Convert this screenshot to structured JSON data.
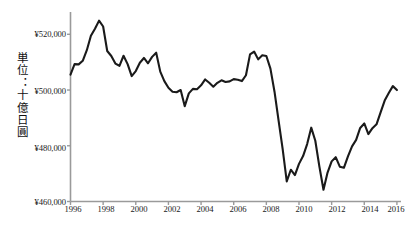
{
  "chart_data": {
    "type": "line",
    "title": "",
    "subtitle": "",
    "xlabel": "",
    "ylabel": "単位：十億日圓",
    "ylabel_reading": "tan'i: jūoku nippon-en (unit: billion yen)",
    "xlim": [
      1996.0,
      2016.25
    ],
    "ylim": [
      460000,
      528000
    ],
    "grid": false,
    "legend": null,
    "legend_position": "none",
    "y_tick_labels": [
      "¥520,000",
      "¥500,000",
      "¥480,000",
      "¥460,000"
    ],
    "y_ticks": [
      520000,
      500000,
      480000,
      460000
    ],
    "x_tick_labels": [
      "1996",
      "1998",
      "2000",
      "2002",
      "2004",
      "2006",
      "2008",
      "2010",
      "2012",
      "2014",
      "2016"
    ],
    "x_ticks": [
      1996,
      1998,
      2000,
      2002,
      2004,
      2006,
      2008,
      2010,
      2012,
      2014,
      2016
    ],
    "line_color": "#1a1a1a",
    "axis_color": "#9a9a9a",
    "background_color": "#ffffff",
    "series": [
      {
        "name": "Real GDP",
        "x": [
          1996.0,
          1996.25,
          1996.5,
          1996.75,
          1997.0,
          1997.25,
          1997.5,
          1997.75,
          1998.0,
          1998.25,
          1998.5,
          1998.75,
          1999.0,
          1999.25,
          1999.5,
          1999.75,
          2000.0,
          2000.25,
          2000.5,
          2000.75,
          2001.0,
          2001.25,
          2001.5,
          2001.75,
          2002.0,
          2002.25,
          2002.5,
          2002.75,
          2003.0,
          2003.25,
          2003.5,
          2003.75,
          2004.0,
          2004.25,
          2004.5,
          2004.75,
          2005.0,
          2005.25,
          2005.5,
          2005.75,
          2006.0,
          2006.25,
          2006.5,
          2006.75,
          2007.0,
          2007.25,
          2007.5,
          2007.75,
          2008.0,
          2008.25,
          2008.5,
          2008.75,
          2009.0,
          2009.25,
          2009.5,
          2009.75,
          2010.0,
          2010.25,
          2010.5,
          2010.75,
          2011.0,
          2011.25,
          2011.5,
          2011.75,
          2012.0,
          2012.25,
          2012.5,
          2012.75,
          2013.0,
          2013.25,
          2013.5,
          2013.75,
          2014.0,
          2014.25,
          2014.5,
          2014.75,
          2015.0,
          2015.25,
          2015.5,
          2015.75,
          2016.0
        ],
        "values": [
          505500,
          509300,
          509200,
          510500,
          514300,
          519500,
          522000,
          524900,
          522800,
          514000,
          512200,
          509500,
          508700,
          512300,
          509300,
          505000,
          506800,
          509800,
          511500,
          509600,
          511900,
          513400,
          506600,
          503200,
          500800,
          499400,
          499200,
          500000,
          494200,
          498800,
          500400,
          500300,
          501700,
          503800,
          502600,
          501200,
          502600,
          503500,
          502900,
          503100,
          503900,
          503700,
          503200,
          505300,
          512800,
          513800,
          511000,
          512500,
          512200,
          507700,
          499400,
          489000,
          478800,
          467200,
          471400,
          469500,
          473500,
          476300,
          480600,
          486500,
          481800,
          472500,
          464200,
          470400,
          474400,
          475900,
          472500,
          472100,
          476200,
          479800,
          482100,
          486400,
          488000,
          484200,
          486300,
          487700,
          492000,
          496200,
          498900,
          501400,
          500000
        ]
      }
    ],
    "annotations": [
      {
        "label": "peak",
        "x": 1997.75,
        "y": 524900
      },
      {
        "label": "financial-crisis-trough",
        "x": 2009.25,
        "y": 467200
      },
      {
        "label": "post-quake-trough",
        "x": 2011.5,
        "y": 464200
      }
    ]
  },
  "axes": {
    "y_axis_name": "y-axis",
    "x_axis_name": "x-axis"
  }
}
